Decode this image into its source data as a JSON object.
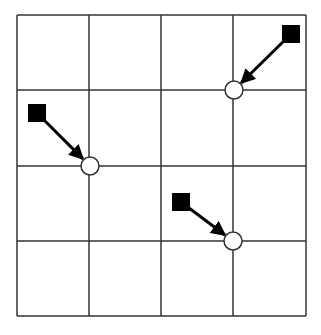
{
  "diagram": {
    "type": "grid-displacement",
    "grid": {
      "rows": 4,
      "cols": 4,
      "x_lines": [
        17,
        89,
        161,
        233,
        306
      ],
      "y_lines": [
        15,
        90,
        166,
        241,
        316
      ],
      "line_color": "#333333"
    },
    "markers": [
      {
        "id": "marker-1",
        "square": {
          "x": 282,
          "y": 25,
          "size": 18
        },
        "target": {
          "x": 234,
          "y": 90
        }
      },
      {
        "id": "marker-2",
        "square": {
          "x": 28,
          "y": 104,
          "size": 18
        },
        "target": {
          "x": 90,
          "y": 166
        }
      },
      {
        "id": "marker-3",
        "square": {
          "x": 172,
          "y": 193,
          "size": 18
        },
        "target": {
          "x": 233,
          "y": 241
        }
      }
    ],
    "circle_radius": 9,
    "square_color": "#000000",
    "arrow_color": "#000000"
  }
}
